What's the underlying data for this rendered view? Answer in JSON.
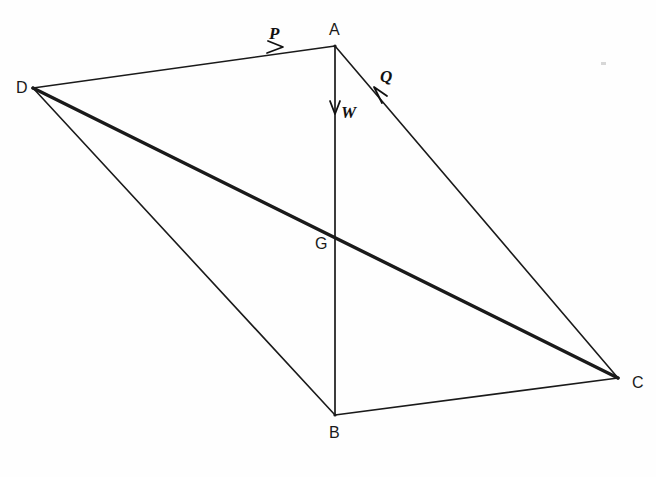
{
  "figure": {
    "type": "force-diagram",
    "width": 656,
    "height": 477,
    "background_color": "#fefefe",
    "ink_color": "#1a1a1a"
  },
  "vertices": [
    {
      "id": "A",
      "label": "A",
      "x": 335,
      "y": 46,
      "label_x": 329,
      "label_y": 22
    },
    {
      "id": "B",
      "label": "B",
      "x": 335,
      "y": 415,
      "label_x": 329,
      "label_y": 425
    },
    {
      "id": "C",
      "label": "C",
      "x": 618,
      "y": 378,
      "label_x": 632,
      "label_y": 375
    },
    {
      "id": "D",
      "label": "D",
      "x": 33,
      "y": 88,
      "label_x": 16,
      "label_y": 80
    },
    {
      "id": "G",
      "label": "G",
      "x": 335,
      "y": 232,
      "label_x": 315,
      "label_y": 236
    }
  ],
  "edges": [
    {
      "id": "DA",
      "from": "D",
      "to": "A",
      "weight": "thin",
      "stroke_width": 1.7
    },
    {
      "id": "AC",
      "from": "A",
      "to": "C",
      "weight": "thin",
      "stroke_width": 1.6
    },
    {
      "id": "BC",
      "from": "B",
      "to": "C",
      "weight": "thin",
      "stroke_width": 1.7
    },
    {
      "id": "DB",
      "from": "D",
      "to": "B",
      "weight": "thin",
      "stroke_width": 1.6
    },
    {
      "id": "DC",
      "from": "D",
      "to": "C",
      "weight": "thick",
      "stroke_width": 3.4
    },
    {
      "id": "AB",
      "from": "A",
      "to": "B",
      "weight": "thin",
      "stroke_width": 1.7
    }
  ],
  "force_vectors": [
    {
      "id": "P",
      "label": "P",
      "on_edge": "DA",
      "direction": "toward-A",
      "arrow_x": 281,
      "arrow_y": 47,
      "label_x": 269,
      "label_y": 25
    },
    {
      "id": "Q",
      "label": "Q",
      "on_edge": "AC",
      "direction": "toward-A",
      "arrow_x": 379,
      "arrow_y": 92,
      "label_x": 380,
      "label_y": 68
    },
    {
      "id": "W",
      "label": "W",
      "on_edge": "AB",
      "direction": "downward",
      "arrow_x": 335,
      "arrow_y": 112,
      "label_x": 341,
      "label_y": 104
    }
  ],
  "artifacts": [
    {
      "id": "scan-speck",
      "x": 601,
      "y": 62
    }
  ]
}
